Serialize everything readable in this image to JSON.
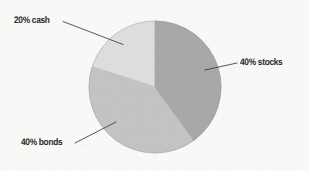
{
  "chart_data": {
    "type": "pie",
    "title": "",
    "subtitle": "",
    "xlabel": "",
    "ylabel": "",
    "grid": false,
    "legend_position": "none",
    "label_style": "callout-with-leader-line",
    "total": 100,
    "units": "percent",
    "categories": [
      "stocks",
      "bonds",
      "cash"
    ],
    "values": [
      40,
      40,
      20
    ],
    "slices": [
      {
        "name": "stocks",
        "label": "40% stocks",
        "value": 40,
        "percent": "40%",
        "color": "#a8a8a8",
        "start_angle_deg": 0,
        "end_angle_deg": 144
      },
      {
        "name": "bonds",
        "label": "40% bonds",
        "value": 40,
        "percent": "40%",
        "color": "#c3c3c3",
        "start_angle_deg": 144,
        "end_angle_deg": 288
      },
      {
        "name": "cash",
        "label": "20% cash",
        "value": 20,
        "percent": "20%",
        "color": "#dddddd",
        "start_angle_deg": 288,
        "end_angle_deg": 360
      }
    ],
    "annotations": [
      {
        "name": "cash",
        "text": "20% cash"
      },
      {
        "name": "stocks",
        "text": "40% stocks"
      },
      {
        "name": "bonds",
        "text": "40% bonds"
      }
    ],
    "colors": {
      "background": "#f8f8f6",
      "stocks": "#a8a8a8",
      "bonds": "#c3c3c3",
      "cash": "#dddddd",
      "slice_outline": "#9b9b9b",
      "leader_line": "#3a3a3a",
      "label_text": "#2b2b2b"
    },
    "geometry": {
      "center_x": 155,
      "center_y": 87,
      "radius": 66
    }
  },
  "labels": {
    "cash": "20% cash",
    "stocks": "40% stocks",
    "bonds": "40% bonds"
  }
}
